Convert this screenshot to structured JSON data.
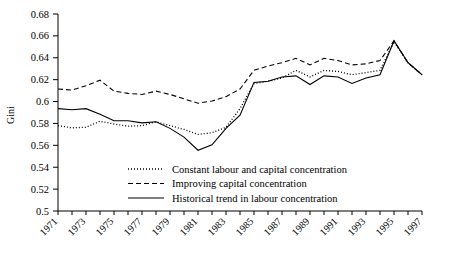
{
  "chart_data": {
    "type": "line",
    "title": "",
    "xlabel": "",
    "ylabel": "Gini",
    "ylim": [
      0.5,
      0.68
    ],
    "ytick_step": 0.02,
    "yticks": [
      "0.5",
      "0.52",
      "0.54",
      "0.56",
      "0.58",
      "0.6",
      "0.62",
      "0.64",
      "0.66",
      "0.68"
    ],
    "x": [
      1971,
      1972,
      1973,
      1974,
      1975,
      1976,
      1977,
      1978,
      1979,
      1980,
      1981,
      1982,
      1983,
      1984,
      1985,
      1986,
      1987,
      1988,
      1989,
      1990,
      1991,
      1992,
      1993,
      1994,
      1995,
      1996,
      1997
    ],
    "xlim": [
      1971,
      1997
    ],
    "xticks_labeled": [
      "1971",
      "1973",
      "1975",
      "1977",
      "1979",
      "1981",
      "1983",
      "1985",
      "1987",
      "1989",
      "1991",
      "1993",
      "1995",
      "1997"
    ],
    "xtick_interval_labeled": 2,
    "xtick_interval_minor": 1,
    "grid": false,
    "legend_position": "inside-bottom-center",
    "series": [
      {
        "name": "Constant labour and capital concentration",
        "style": "dotted",
        "values": [
          0.578,
          0.576,
          0.5765,
          0.582,
          0.5795,
          0.5775,
          0.578,
          0.5815,
          0.578,
          0.5745,
          0.57,
          0.5715,
          0.5765,
          0.5935,
          0.6165,
          0.6185,
          0.6215,
          0.6285,
          0.6225,
          0.6285,
          0.6275,
          0.6245,
          0.6265,
          0.6285,
          0.6545,
          0.6355,
          0.6245
        ]
      },
      {
        "name": "Improving capital concentration",
        "style": "dashed",
        "values": [
          0.6115,
          0.6105,
          0.6145,
          0.6195,
          0.6095,
          0.6075,
          0.6065,
          0.6095,
          0.6065,
          0.6025,
          0.5985,
          0.6005,
          0.6045,
          0.6115,
          0.6285,
          0.6325,
          0.6355,
          0.6395,
          0.6335,
          0.6395,
          0.6375,
          0.6335,
          0.6345,
          0.6375,
          0.6555,
          0.6355,
          0.6245
        ]
      },
      {
        "name": "Historical trend in labour concentration",
        "style": "solid",
        "values": [
          0.5935,
          0.5925,
          0.5935,
          0.5885,
          0.5825,
          0.5825,
          0.5805,
          0.5815,
          0.5755,
          0.5675,
          0.5555,
          0.5605,
          0.5755,
          0.5875,
          0.6175,
          0.6185,
          0.6225,
          0.6235,
          0.6155,
          0.6235,
          0.6225,
          0.6165,
          0.6215,
          0.6245,
          0.6555,
          0.6355,
          0.6245
        ]
      }
    ]
  },
  "legend": {
    "items": [
      {
        "label": "Constant labour and capital concentration",
        "style": "dotted"
      },
      {
        "label": "Improving capital concentration",
        "style": "dashed"
      },
      {
        "label": "Historical trend in labour concentration",
        "style": "solid"
      }
    ]
  },
  "colors": {
    "axis": "#000000",
    "line": "#000000",
    "background": "#ffffff"
  }
}
